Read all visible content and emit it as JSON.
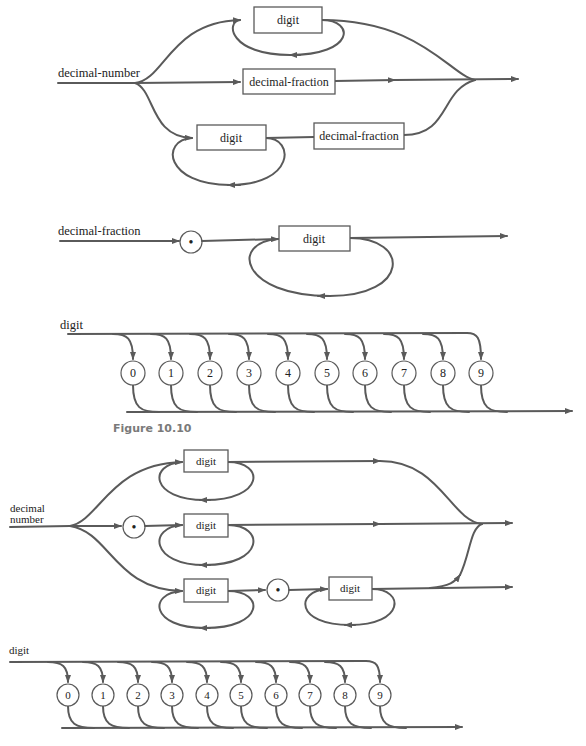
{
  "colors": {
    "line": "#5a5a5a",
    "text": "#222222",
    "caption": "#7a7a7a",
    "background": "#ffffff"
  },
  "diagrams": {
    "decimal_number_a": {
      "label": "decimal-number",
      "top_box": "digit",
      "middle_box": "decimal-fraction",
      "bottom_box_1": "digit",
      "bottom_box_2": "decimal-fraction"
    },
    "decimal_fraction": {
      "label": "decimal-fraction",
      "dot_symbol": "•",
      "box": "digit"
    },
    "digit_a": {
      "label": "digit",
      "digits": [
        "0",
        "1",
        "2",
        "3",
        "4",
        "5",
        "6",
        "7",
        "8",
        "9"
      ]
    },
    "caption_1": "Figure 10.10",
    "decimal_number_b": {
      "label_line1": "decimal",
      "label_line2": "number",
      "top_box": "digit",
      "middle_dot": "•",
      "middle_box": "digit",
      "bottom_box_1": "digit",
      "bottom_dot": "•",
      "bottom_box_2": "digit"
    },
    "digit_b": {
      "label": "digit",
      "digits": [
        "0",
        "1",
        "2",
        "3",
        "4",
        "5",
        "6",
        "7",
        "8",
        "9"
      ]
    }
  }
}
